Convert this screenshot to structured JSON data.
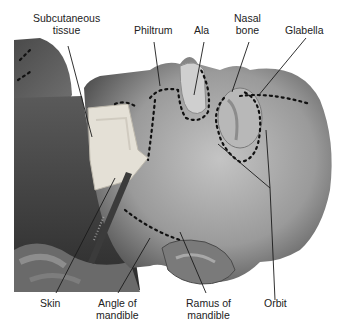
{
  "figure": {
    "colors": {
      "background": "#ffffff",
      "skin_dark": "#3a3a3a",
      "skin_mid": "#8a8a8a",
      "skin_light": "#c8c8c8",
      "tissue": "#e6e2d8",
      "leader_line": "#1a1a1a",
      "markings": "#111111"
    },
    "labels": {
      "subcutaneous_tissue": {
        "line1": "Subcutaneous",
        "line2": "tissue"
      },
      "philtrum": {
        "line1": "Philtrum"
      },
      "ala": {
        "line1": "Ala"
      },
      "nasal_bone": {
        "line1": "Nasal",
        "line2": "bone"
      },
      "glabella": {
        "line1": "Glabella"
      },
      "skin": {
        "line1": "Skin"
      },
      "angle_of_mandible": {
        "line1": "Angle of",
        "line2": "mandible"
      },
      "ramus_of_mandible": {
        "line1": "Ramus of",
        "line2": "mandible"
      },
      "orbit": {
        "line1": "Orbit"
      }
    }
  }
}
